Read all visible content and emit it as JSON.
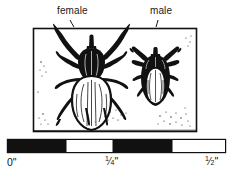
{
  "figure": {
    "kind": "line-art-illustration",
    "labels": {
      "female": "female",
      "male": "male"
    },
    "frame": {
      "present": true,
      "stroke_color": "#111111"
    },
    "specimens": [
      {
        "name": "female-tick",
        "label": "female",
        "relative_size": "larger",
        "body_shading": "light",
        "legs": 8
      },
      {
        "name": "male-tick",
        "label": "male",
        "relative_size": "smaller",
        "body_shading": "dark",
        "legs": 8
      }
    ]
  },
  "scale_bar": {
    "name": "ruler",
    "units": "inches",
    "segment_colors": {
      "filled": "#111111",
      "empty": "#ffffff"
    },
    "segments": [
      {
        "fill": "filled"
      },
      {
        "fill": "empty"
      },
      {
        "fill": "filled"
      },
      {
        "fill": "empty"
      }
    ],
    "ticks": [
      {
        "value": "0",
        "label_whole": "0",
        "label_suffix": "\""
      },
      {
        "value": "1/4",
        "numerator": "1",
        "denominator": "4",
        "label_suffix": "\""
      },
      {
        "value": "1/2",
        "numerator": "1",
        "denominator": "2",
        "label_suffix": "\""
      }
    ],
    "tick_labels": {
      "zero": "0\"",
      "quarter": "1/4\"",
      "half": "1/2\""
    }
  },
  "colors": {
    "ink": "#111111",
    "background": "#ffffff"
  }
}
